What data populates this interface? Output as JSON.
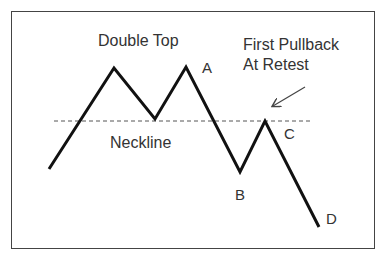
{
  "diagram": {
    "title": "Double Top",
    "annotation": {
      "line1": "First Pullback",
      "line2": "At Retest"
    },
    "neckline_label": "Neckline",
    "points": {
      "A": "A",
      "B": "B",
      "C": "C",
      "D": "D"
    },
    "colors": {
      "line": "#111111",
      "neckline": "#555555",
      "text": "#333333",
      "border": "#444444",
      "background": "#ffffff"
    },
    "price_path": [
      [
        49,
        169
      ],
      [
        114,
        68
      ],
      [
        155,
        119
      ],
      [
        186,
        67
      ],
      [
        240,
        172
      ],
      [
        265,
        121
      ],
      [
        319,
        227
      ]
    ],
    "neckline": {
      "x1": 54,
      "x2": 312,
      "y": 121
    },
    "arrow": {
      "x1": 305,
      "y1": 87,
      "x2": 272,
      "y2": 107
    }
  }
}
